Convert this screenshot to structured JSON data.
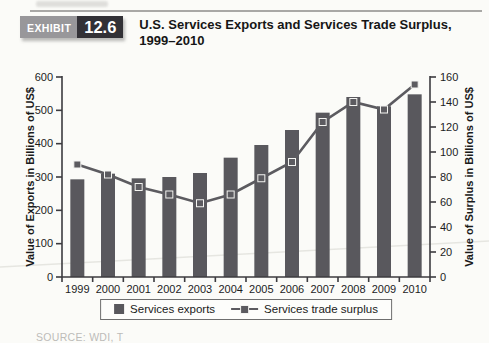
{
  "exhibit": {
    "label": "EXHIBIT",
    "number": "12.6"
  },
  "title": {
    "line1": "U.S. Services Exports and Services Trade Surplus,",
    "line2": "1999–2010"
  },
  "source_text": "SOURCE: WDI, T",
  "colors": {
    "bar": "#59585d",
    "line": "#5c5b60",
    "axis": "#3c3b3f",
    "tick_text": "#1c1c1e",
    "crease": "#e6e6e1"
  },
  "chart_data": {
    "type": "bar+line",
    "title": "U.S. Services Exports and Services Trade Surplus, 1999–2010",
    "categories": [
      "1999",
      "2000",
      "2001",
      "2002",
      "2003",
      "2004",
      "2005",
      "2006",
      "2007",
      "2008",
      "2009",
      "2010"
    ],
    "series": [
      {
        "name": "Services exports",
        "type": "bar",
        "axis": "left",
        "color": "#59585d",
        "values": [
          293,
          310,
          296,
          300,
          312,
          358,
          396,
          441,
          493,
          540,
          512,
          548
        ]
      },
      {
        "name": "Services trade surplus",
        "type": "line",
        "axis": "right",
        "color": "#5c5b60",
        "values": [
          90,
          82,
          72,
          66,
          59,
          66,
          79,
          92,
          124,
          140,
          134,
          154
        ]
      }
    ],
    "left_axis": {
      "label": "Value of Exports in Billions of US$",
      "min": 0,
      "max": 600,
      "step": 100
    },
    "right_axis": {
      "label": "Value of Surplus in Billions of US$",
      "min": 0,
      "max": 160,
      "step": 20
    },
    "legend": {
      "position": "bottom",
      "items": [
        "Services exports",
        "Services trade surplus"
      ]
    },
    "grid": false
  }
}
